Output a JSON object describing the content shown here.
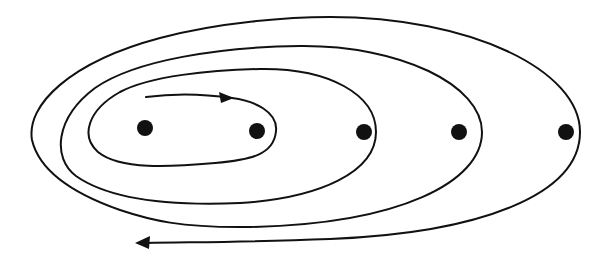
{
  "diagram": {
    "type": "spiral-trajectory",
    "colors": {
      "stroke": "#111111",
      "background": "#ffffff"
    },
    "points": [
      {
        "id": "p1",
        "x": 145,
        "y": 128
      },
      {
        "id": "p2",
        "x": 257,
        "y": 131
      },
      {
        "id": "p3",
        "x": 364,
        "y": 132
      },
      {
        "id": "p4",
        "x": 459,
        "y": 132
      },
      {
        "id": "p5",
        "x": 566,
        "y": 132
      }
    ],
    "arrows": [
      {
        "id": "start-arrow",
        "direction": "right",
        "x": 230,
        "y": 98
      },
      {
        "id": "end-arrow",
        "direction": "left",
        "x": 137,
        "y": 243
      }
    ],
    "loops": 4
  }
}
